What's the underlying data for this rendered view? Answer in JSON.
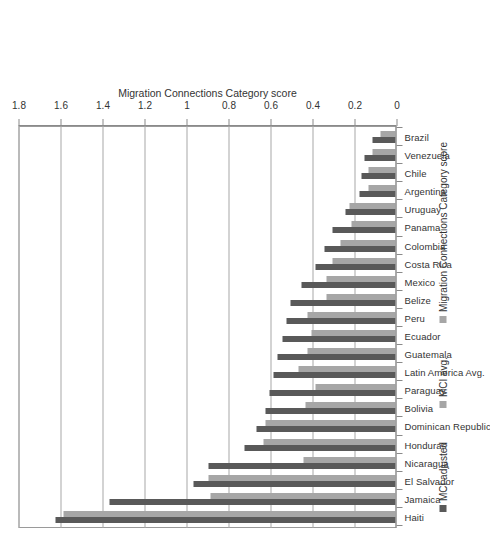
{
  "chart_data": {
    "type": "bar",
    "title": "",
    "xlabel": "",
    "ylabel": "Migration Connections Category score",
    "ylim": [
      0,
      1.8
    ],
    "grid": true,
    "orientation": "vertical-bars-rotated-90ccw",
    "legend_position": "bottom",
    "tick_labels": [
      "0",
      "0.2",
      "0.4",
      "0.6",
      "0.8",
      "1",
      "1.2",
      "1.4",
      "1.6",
      "1.8"
    ],
    "tick_values": [
      0,
      0.2,
      0.4,
      0.6,
      0.8,
      1.0,
      1.2,
      1.4,
      1.6,
      1.8
    ],
    "categories": [
      "Haiti",
      "Jamaica",
      "El Salvador",
      "Nicaragua",
      "Honduras",
      "Dominican Republic",
      "Bolivia",
      "Paraguay",
      "Latin America Avg.",
      "Guatemala",
      "Ecuador",
      "Peru",
      "Belize",
      "Mexico",
      "Costa Rica",
      "Colombia",
      "Panama",
      "Uruguay",
      "Argentina",
      "Chile",
      "Venezuela",
      "Brazil"
    ],
    "series": [
      {
        "name": "MCI adjusted",
        "color": "#595959",
        "values": [
          1.62,
          1.36,
          0.96,
          0.89,
          0.72,
          0.66,
          0.62,
          0.6,
          0.58,
          0.56,
          0.54,
          0.52,
          0.5,
          0.45,
          0.38,
          0.34,
          0.3,
          0.24,
          0.17,
          0.16,
          0.15,
          0.11
        ]
      },
      {
        "name": "MCI avg.",
        "color": "#a6a6a6",
        "values": [
          1.58,
          0.88,
          0.89,
          0.44,
          0.63,
          0.62,
          0.43,
          0.38,
          0.46,
          0.42,
          0.4,
          0.42,
          0.33,
          0.33,
          0.3,
          0.26,
          0.21,
          0.22,
          0.13,
          0.13,
          0.11,
          0.07
        ]
      }
    ]
  },
  "legend": {
    "items": [
      {
        "label": "MCI adjusted",
        "color": "#595959"
      },
      {
        "label": "MCI avg.",
        "color": "#a6a6a6"
      },
      {
        "label": "Migration Connections Category score",
        "color": "#a6a6a6"
      }
    ]
  },
  "axis": {
    "value_axis_title": "Migration Connections Category score"
  },
  "colors": {
    "series_dark": "#595959",
    "series_light": "#a6a6a6",
    "gridline": "#a8a8a8",
    "frame": "#9a9a9a",
    "text": "#333333",
    "background": "#ffffff"
  }
}
